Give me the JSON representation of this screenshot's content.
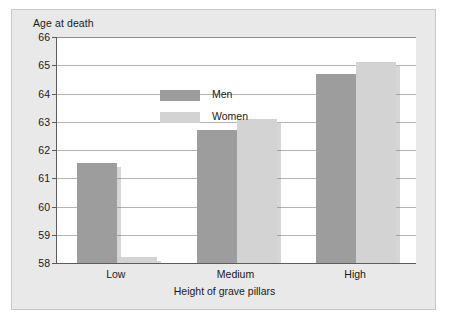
{
  "chart_data": {
    "type": "bar",
    "title": "",
    "subtitle": "",
    "xlabel": "Height of grave pillars",
    "ylabel": "Age at death",
    "categories": [
      "Low",
      "Medium",
      "High"
    ],
    "series": [
      {
        "name": "Men",
        "color": "#9d9d9d",
        "values": [
          61.55,
          62.72,
          64.68
        ]
      },
      {
        "name": "Women",
        "color": "#d3d3d3",
        "values": [
          58.2,
          63.1,
          65.1
        ]
      }
    ],
    "ylim": [
      58,
      66
    ],
    "ytick_labels": [
      "66",
      "65",
      "64",
      "63",
      "62",
      "61",
      "60",
      "59",
      "58"
    ],
    "yticks": [
      66,
      65,
      64,
      63,
      62,
      61,
      60,
      59,
      58
    ],
    "grid": true,
    "grid_axis": "y",
    "legend_position": "inside-top-left",
    "legend_entries": [
      "Men",
      "Women"
    ],
    "annotations": []
  },
  "axes": {
    "y_title": "Age at death",
    "x_title": "Height of grave pillars"
  },
  "legend": {
    "items": [
      {
        "label": "Men"
      },
      {
        "label": "Women"
      }
    ]
  },
  "colors": {
    "men_bar": "#9d9d9d",
    "women_bar": "#d3d3d3",
    "panel_background": "#e9e9e9",
    "plot_background": "#ffffff",
    "gridline": "#b4b4b4",
    "axis_line": "#5c5c5c",
    "text": "#1a1a1a"
  }
}
